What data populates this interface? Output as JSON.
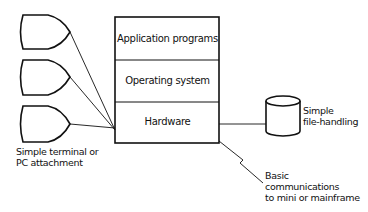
{
  "diagram": {
    "stack": {
      "layers": [
        {
          "label": "Application programs"
        },
        {
          "label": "Operating system"
        },
        {
          "label": "Hardware"
        }
      ]
    },
    "terminals": {
      "count": 3,
      "label_line1": "Simple terminal or",
      "label_line2": "PC attachment"
    },
    "storage": {
      "label_line1": "Simple",
      "label_line2": "file-handling"
    },
    "communications": {
      "label_line1": "Basic",
      "label_line2": "communications",
      "label_line3": "to mini or mainframe"
    },
    "colors": {
      "stroke": "#111111",
      "background": "#ffffff"
    }
  }
}
